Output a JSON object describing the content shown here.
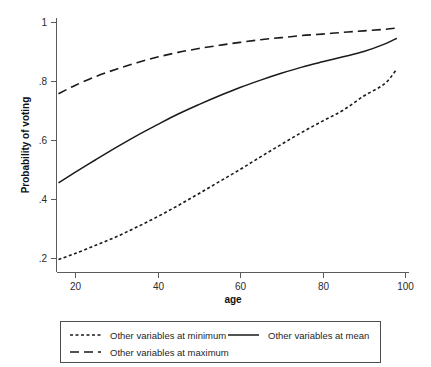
{
  "chart_data": {
    "type": "line",
    "title": "",
    "xlabel": "age",
    "ylabel": "Probability of voting",
    "xlim": [
      14.5,
      100
    ],
    "ylim": [
      0.17,
      1.02
    ],
    "xticks": [
      20,
      40,
      60,
      80,
      100
    ],
    "xtick_labels": [
      "20",
      "40",
      "60",
      "80",
      "100"
    ],
    "yticks": [
      0.2,
      0.4,
      0.6,
      0.8,
      1.0
    ],
    "ytick_labels": [
      ".2",
      ".4",
      ".6",
      ".8",
      "1"
    ],
    "grid": false,
    "legend_position": "below",
    "x": [
      16,
      20,
      25,
      30,
      35,
      40,
      45,
      50,
      55,
      60,
      65,
      70,
      75,
      80,
      85,
      90,
      95,
      98
    ],
    "series": [
      {
        "name": "Other variables at minimum",
        "style": "dotted",
        "color": "#1a1a1a",
        "values": [
          0.195,
          0.215,
          0.243,
          0.272,
          0.305,
          0.34,
          0.378,
          0.418,
          0.459,
          0.5,
          0.543,
          0.585,
          0.626,
          0.664,
          0.701,
          0.749,
          0.79,
          0.84
        ]
      },
      {
        "name": "Other variables at mean",
        "style": "solid",
        "color": "#1a1a1a",
        "values": [
          0.455,
          0.49,
          0.533,
          0.575,
          0.615,
          0.652,
          0.688,
          0.72,
          0.75,
          0.778,
          0.803,
          0.826,
          0.847,
          0.865,
          0.882,
          0.9,
          0.925,
          0.945
        ]
      },
      {
        "name": "Other variables at maximum",
        "style": "dashed",
        "color": "#1a1a1a",
        "values": [
          0.757,
          0.785,
          0.815,
          0.84,
          0.862,
          0.881,
          0.897,
          0.91,
          0.921,
          0.931,
          0.94,
          0.947,
          0.954,
          0.959,
          0.965,
          0.97,
          0.975,
          0.98
        ]
      }
    ],
    "legend_entries": [
      {
        "label": "Other variables at minimum",
        "style": "dotted"
      },
      {
        "label": "Other variables at mean",
        "style": "solid"
      },
      {
        "label": "Other variables at maximum",
        "style": "dashed"
      }
    ]
  }
}
